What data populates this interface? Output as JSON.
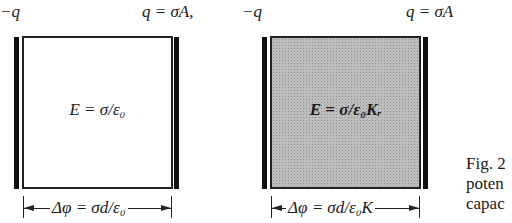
{
  "capacitor_vacuum": {
    "left_charge": "−q",
    "right_charge": "q = σA,",
    "field": "E = σ/ε₀",
    "potential": "Δφ = σd/ε₀"
  },
  "capacitor_dielectric": {
    "left_charge": "−q",
    "right_charge": "q = σA",
    "field": "E = σ/ε₀Kᵣ",
    "potential": "Δφ = σd/ε₀K"
  },
  "caption": {
    "line1": "Fig. 2",
    "line2": "poten",
    "line3": "capac"
  },
  "colors": {
    "plate": "#111111",
    "dielectric_fill": "#bdbdbd"
  }
}
